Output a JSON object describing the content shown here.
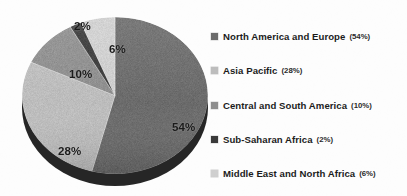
{
  "chart_data": {
    "type": "pie",
    "title": "",
    "categories": [
      "North America and Europe",
      "Asia Pacific",
      "Central and South America",
      "Sub-Saharan Africa",
      "Middle East and North Africa"
    ],
    "values": [
      54,
      28,
      10,
      2,
      6
    ],
    "value_unit": "%",
    "slice_labels": [
      "54%",
      "28%",
      "10%",
      "2%",
      "6%"
    ],
    "colors": [
      "#6b6b6b",
      "#bdbdbd",
      "#8e8e8e",
      "#3a3a3a",
      "#cfcfcf"
    ],
    "start_angle_deg": 0,
    "direction": "clockwise",
    "style": "3d",
    "legend_position": "right",
    "grid": false,
    "xlabel": "",
    "ylabel": ""
  },
  "pie": {
    "labels": {
      "slice_54": "54%",
      "slice_28": "28%",
      "slice_10": "10%",
      "slice_2": "2%",
      "slice_6": "6%"
    }
  },
  "legend": {
    "items": [
      {
        "name": "North America and Europe",
        "percent": "(54%)",
        "color": "#6b6b6b"
      },
      {
        "name": "Asia Pacific",
        "percent": "(28%)",
        "color": "#bdbdbd"
      },
      {
        "name": "Central and South America",
        "percent": "(10%)",
        "color": "#8e8e8e"
      },
      {
        "name": "Sub-Saharan Africa",
        "percent": "(2%)",
        "color": "#3a3a3a"
      },
      {
        "name": "Middle East and North Africa",
        "percent": "(6%)",
        "color": "#cfcfcf"
      }
    ]
  }
}
